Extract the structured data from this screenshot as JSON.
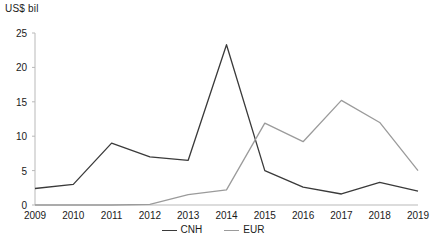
{
  "chart_data": {
    "type": "line",
    "title": "",
    "ylabel": "US$ bil",
    "xlabel": "",
    "categories": [
      "2009",
      "2010",
      "2011",
      "2012",
      "2013",
      "2014",
      "2015",
      "2016",
      "2017",
      "2018",
      "2019"
    ],
    "x": [
      2009,
      2010,
      2011,
      2012,
      2013,
      2014,
      2015,
      2016,
      2017,
      2018,
      2019
    ],
    "ylim": [
      0,
      25
    ],
    "yticks": [
      0,
      5,
      10,
      15,
      20,
      25
    ],
    "grid": false,
    "legend_position": "bottom-center",
    "series": [
      {
        "name": "CNH",
        "color": "#3a3a3a",
        "values": [
          2.4,
          3.0,
          9.0,
          7.0,
          6.5,
          23.3,
          5.0,
          2.6,
          1.6,
          3.3,
          2.0
        ]
      },
      {
        "name": "EUR",
        "color": "#9b9b9b",
        "values": [
          0.0,
          0.0,
          0.0,
          0.1,
          1.5,
          2.2,
          11.9,
          9.2,
          15.2,
          12.0,
          5.0
        ]
      }
    ]
  },
  "legend": {
    "items": [
      {
        "label": "CNH",
        "color": "#3a3a3a"
      },
      {
        "label": "EUR",
        "color": "#9b9b9b"
      }
    ]
  }
}
